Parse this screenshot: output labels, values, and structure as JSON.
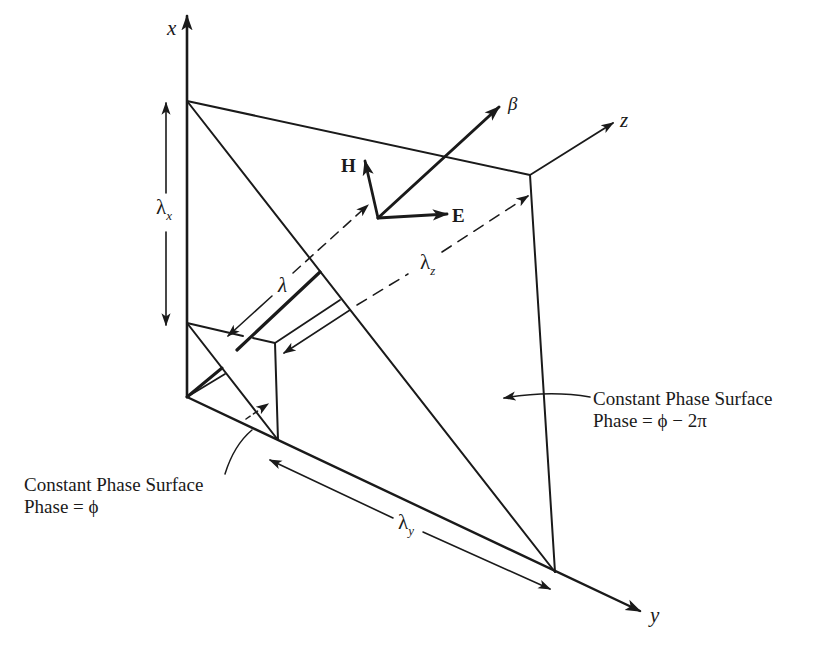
{
  "diagram": {
    "type": "3d-plane-wave-geometry",
    "axes": {
      "x": "x",
      "y": "y",
      "z": "z"
    },
    "vectors": {
      "propagation": "β",
      "electric_field": "E",
      "magnetic_field": "H"
    },
    "wavelengths": {
      "lambda": "λ",
      "lambda_x": {
        "symbol": "λ",
        "subscript": "x"
      },
      "lambda_y": {
        "symbol": "λ",
        "subscript": "y"
      },
      "lambda_z": {
        "symbol": "λ",
        "subscript": "z"
      }
    },
    "surfaces": {
      "near": {
        "title": "Constant Phase Surface",
        "phase": "Phase = ϕ"
      },
      "far": {
        "title": "Constant Phase Surface",
        "phase": "Phase = ϕ − 2π"
      }
    },
    "colors": {
      "ink": "#1a1a1a",
      "background": "#ffffff"
    }
  }
}
